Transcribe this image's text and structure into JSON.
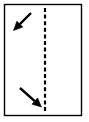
{
  "figure": {
    "canvas": {
      "width": 89,
      "height": 122
    },
    "background_color": "#ffffff",
    "stroke_color": "#000000"
  },
  "frame": {
    "label": "panel-border",
    "x": 4.5,
    "y": 4.5,
    "width": 77,
    "height": 111,
    "stroke_color": "#000000",
    "stroke_width": 1.4,
    "fill": "none"
  },
  "dashed_line": {
    "label": "vertical-dashed-fold-line",
    "orientation": "vertical",
    "x": 45,
    "y_start": 8,
    "y_end": 112,
    "stroke_color": "#000000",
    "stroke_width": 2.2,
    "dash_length": 4,
    "gap_length": 2.6
  },
  "arrows": [
    {
      "label": "arrow-top-left",
      "direction": "down-left",
      "heading_degrees": 225,
      "tail_x": 31,
      "tail_y": 13,
      "tip_x": 13.5,
      "tip_y": 30.5,
      "stroke_color": "#000000",
      "stroke_width": 2.4,
      "head_length": 9,
      "head_half_width": 4.2
    },
    {
      "label": "arrow-bottom-left",
      "direction": "down-right",
      "heading_degrees": 315,
      "tail_x": 20,
      "tail_y": 88,
      "tip_x": 41.5,
      "tip_y": 107,
      "stroke_color": "#000000",
      "stroke_width": 2.4,
      "head_length": 9,
      "head_half_width": 4.2
    }
  ]
}
